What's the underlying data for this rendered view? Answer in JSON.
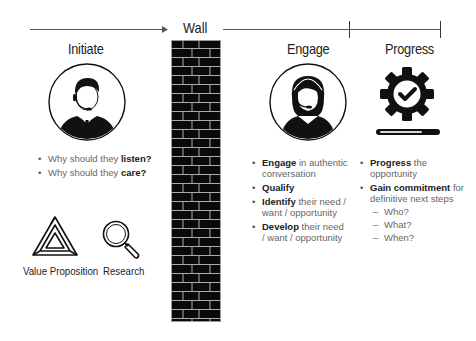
{
  "timeline": {
    "wall_label": "Wall",
    "stages": [
      {
        "label": "Initiate"
      },
      {
        "label": "Engage"
      },
      {
        "label": "Progress"
      }
    ]
  },
  "initiate": {
    "title": "Initiate",
    "icon": "male-headset-agent-icon",
    "bullets": [
      {
        "prefix": "Why should they ",
        "bold": "listen?",
        "suffix": ""
      },
      {
        "prefix": "Why should they ",
        "bold": "care?",
        "suffix": ""
      }
    ],
    "tools": [
      {
        "icon": "impossible-triangle-icon",
        "label": "Value Proposition"
      },
      {
        "icon": "magnifier-icon",
        "label": "Research"
      }
    ]
  },
  "engage": {
    "title": "Engage",
    "icon": "female-headset-agent-icon",
    "bullets": [
      {
        "bold": "Engage",
        "rest": " in authentic conversation"
      },
      {
        "bold": "Qualify",
        "rest": ""
      },
      {
        "bold": "Identify",
        "rest": " their need / want / opportunity"
      },
      {
        "bold": "Develop",
        "rest": " their need / want / opportunity"
      }
    ]
  },
  "progress": {
    "title": "Progress",
    "icon": "gear-checkmark-icon",
    "bar_fill_percent": 75,
    "bullets": [
      {
        "bold": "Progress",
        "rest": " the opportunity"
      },
      {
        "bold": "Gain commitment",
        "rest": " for definitive next steps"
      }
    ],
    "sub_bullets": [
      "Who?",
      "What?",
      "When?"
    ]
  },
  "colors": {
    "ink": "#0a0a0a",
    "line": "#555555",
    "muted_text": "#666666",
    "mortar": "#bdbdbd"
  }
}
